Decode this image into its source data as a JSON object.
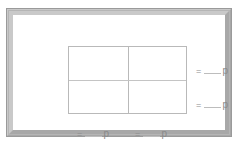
{
  "figure": {
    "frame": {
      "border_light": "#c9c9c9",
      "border_dark": "#a8a8a8",
      "outline": "#9a9a9a",
      "background": "#ffffff"
    },
    "grid": {
      "rows": 2,
      "columns": 2,
      "line_color": "#b9b9b9",
      "fill": "#ffffff",
      "cells": [
        "",
        "",
        "",
        ""
      ]
    },
    "labels": {
      "equals": "=",
      "blank": "",
      "unit": "p",
      "row_top": {
        "equals": "=",
        "unit": "p"
      },
      "row_bottom": {
        "equals": "=",
        "unit": "p"
      },
      "col_left": {
        "equals": "=",
        "unit": "p"
      },
      "col_right": {
        "equals": "=",
        "unit": "p"
      }
    }
  }
}
